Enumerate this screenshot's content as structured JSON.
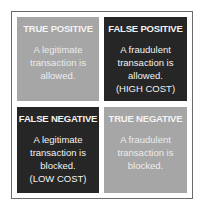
{
  "matrix": {
    "colors": {
      "light_cell": "#a6a6a6",
      "dark_cell": "#262626",
      "text": "#ffffff",
      "border": "#6a6a6a"
    },
    "cells": [
      {
        "id": "true-positive",
        "title": "TRUE POSITIVE",
        "lines": [
          "A legitimate",
          "transaction is",
          "allowed."
        ],
        "shade": "light"
      },
      {
        "id": "false-positive",
        "title": "FALSE POSITIVE",
        "lines": [
          "A fraudulent",
          "transaction is",
          "allowed.",
          "(HIGH COST)"
        ],
        "shade": "dark"
      },
      {
        "id": "false-negative",
        "title": "FALSE NEGATIVE",
        "lines": [
          "A legitimate",
          "transaction is",
          "blocked.",
          "(LOW COST)"
        ],
        "shade": "dark"
      },
      {
        "id": "true-negative",
        "title": "TRUE NEGATIVE",
        "lines": [
          "A fraudulent",
          "transaction is",
          "blocked."
        ],
        "shade": "light"
      }
    ]
  }
}
